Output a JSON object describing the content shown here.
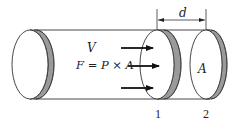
{
  "diagram": {
    "type": "cylinder-pressure-force",
    "labels": {
      "velocity": "V",
      "force_equation": "F = P × A",
      "area": "A",
      "distance": "d",
      "section_1": "1",
      "section_2": "2"
    },
    "arrows": {
      "count": 3,
      "direction": "right",
      "meaning": "pressure force acting on section 1"
    },
    "colors": {
      "outline": "#222222",
      "rim_shade": "#9a9a9a",
      "background": "#ffffff"
    }
  }
}
